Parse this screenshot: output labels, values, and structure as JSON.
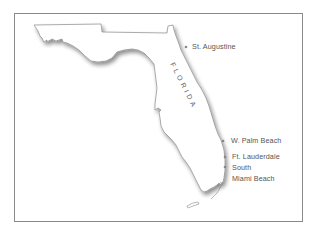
{
  "map": {
    "state_name": "FLORIDA",
    "state_letters": [
      "F",
      "L",
      "O",
      "R",
      "I",
      "D",
      "A"
    ],
    "colors": {
      "frame_border": "#8a8a8a",
      "coastline": "#888888",
      "shadow": "#bbbbbb",
      "city_dot": "#888888",
      "label_text": "#555555"
    },
    "cities": [
      {
        "name": "St. Augustine",
        "label": "St. Augustine"
      },
      {
        "name": "West Palm Beach",
        "label": "W. Palm Beach"
      },
      {
        "name": "Fort Lauderdale",
        "label": "Ft. Lauderdale"
      },
      {
        "name": "South Miami Beach",
        "label_line1": "South",
        "label_line2": "Miami Beach"
      }
    ]
  }
}
